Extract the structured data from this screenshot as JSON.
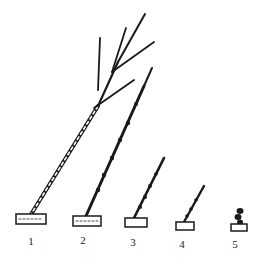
{
  "figure": {
    "labels": [
      "1",
      "2",
      "3",
      "4",
      "5"
    ],
    "colors": {
      "ink": "#1a1a1a",
      "background": "#ffffff"
    }
  }
}
